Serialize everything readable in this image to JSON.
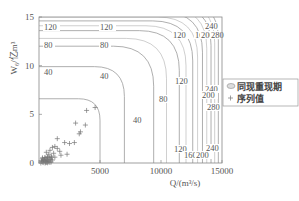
{
  "chart_data": {
    "type": "contour+scatter",
    "title": "",
    "xlabel": "Q/(m³/s)",
    "ylabel": "W₆/亿m³",
    "xlim": [
      0,
      15000
    ],
    "ylim": [
      0,
      15
    ],
    "xticks": [
      0,
      5000,
      10000,
      15000
    ],
    "xtick_labels": [
      "",
      "5000",
      "10000",
      "15000"
    ],
    "yticks": [
      0,
      5,
      10,
      15
    ],
    "ytick_labels": [
      "0",
      "5",
      "10",
      "15"
    ],
    "contour_levels": [
      40,
      80,
      120,
      160,
      200,
      240,
      280
    ],
    "contours": [
      {
        "level": 20,
        "vertical_x": 5000,
        "horizontal_y": 6.6,
        "label": ""
      },
      {
        "level": 40,
        "vertical_x": 7000,
        "horizontal_y": 9.9,
        "label": "40"
      },
      {
        "level": 80,
        "vertical_x": 9400,
        "horizontal_y": 12.0,
        "label": "80"
      },
      {
        "level": 120,
        "vertical_x": 11500,
        "horizontal_y": 13.6,
        "label": "120"
      },
      {
        "level": 160,
        "vertical_x": 12600,
        "horizontal_y": 14.6,
        "label": "160"
      },
      {
        "level": 200,
        "vertical_x": 13400,
        "horizontal_y": 15.5,
        "label": "200"
      },
      {
        "level": 240,
        "vertical_x": 14100,
        "horizontal_y": 16.2,
        "label": "240"
      },
      {
        "level": 280,
        "vertical_x": 14700,
        "horizontal_y": 16.8,
        "label": "280"
      }
    ],
    "series": [
      {
        "name": "序列值",
        "marker": "+",
        "points": [
          [
            4600,
            5.7
          ],
          [
            3900,
            5.4
          ],
          [
            3000,
            4.1
          ],
          [
            3800,
            3.9
          ],
          [
            3400,
            3.2
          ],
          [
            3300,
            3.0
          ],
          [
            1500,
            2.5
          ],
          [
            2100,
            2.1
          ],
          [
            2500,
            2.0
          ],
          [
            2900,
            2.1
          ],
          [
            1100,
            1.6
          ],
          [
            1300,
            1.7
          ],
          [
            1500,
            1.5
          ],
          [
            900,
            1.3
          ],
          [
            1700,
            1.2
          ],
          [
            1200,
            1.0
          ],
          [
            2300,
            0.9
          ],
          [
            1800,
            0.8
          ],
          [
            600,
            1.1
          ],
          [
            800,
            0.9
          ],
          [
            1000,
            0.7
          ],
          [
            700,
            0.6
          ],
          [
            1300,
            0.6
          ],
          [
            500,
            0.5
          ],
          [
            900,
            0.4
          ],
          [
            400,
            0.3
          ],
          [
            700,
            0.2
          ],
          [
            1100,
            0.3
          ],
          [
            300,
            0.1
          ],
          [
            600,
            0.05
          ],
          [
            800,
            0.1
          ],
          [
            200,
            0.2
          ],
          [
            500,
            0.0
          ],
          [
            1000,
            0.1
          ]
        ]
      },
      {
        "name": "同现重现期",
        "marker": "ellipse",
        "points": []
      }
    ],
    "legend": {
      "position": "right-center",
      "entries": [
        "同现重现期",
        "序列值"
      ]
    },
    "grid": false
  },
  "axes": {
    "xlabel": "Q/(m³/s)",
    "ylabel": "W₆/亿m³"
  },
  "legend": {
    "entry_1": "同现重现期",
    "entry_2": "序列值"
  }
}
